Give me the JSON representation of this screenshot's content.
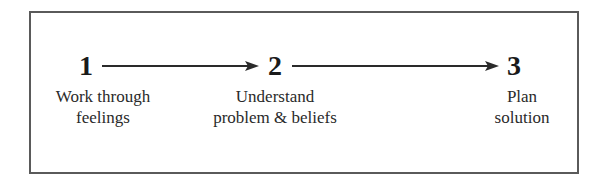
{
  "diagram": {
    "type": "process-flow",
    "direction": "left-to-right",
    "steps": [
      {
        "number": "1",
        "label_line1": "Work through",
        "label_line2": "feelings"
      },
      {
        "number": "2",
        "label_line1": "Understand",
        "label_line2": "problem & beliefs"
      },
      {
        "number": "3",
        "label_line1": "Plan",
        "label_line2": "solution"
      }
    ],
    "connectors": [
      {
        "from": "1",
        "to": "2",
        "style": "arrow"
      },
      {
        "from": "2",
        "to": "3",
        "style": "arrow"
      }
    ],
    "colors": {
      "border": "#5a5a5a",
      "text": "#1a1a1a",
      "arrow": "#2a2a2a",
      "background": "#ffffff"
    }
  }
}
